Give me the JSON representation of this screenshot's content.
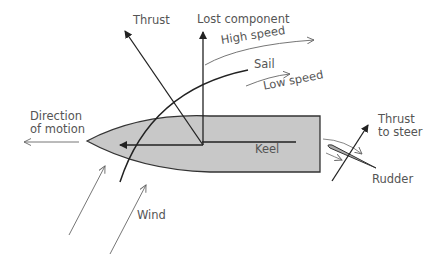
{
  "diagram": {
    "labels": {
      "thrust": "Thrust",
      "lost_component": "Lost component",
      "high_speed": "High speed",
      "sail": "Sail",
      "low_speed": "Low speed",
      "direction_line1": "Direction",
      "direction_line2": "of motion",
      "keel": "Keel",
      "thrust_to_steer_line1": "Thrust",
      "thrust_to_steer_line2": "to steer",
      "rudder": "Rudder",
      "wind": "Wind"
    },
    "colors": {
      "hull_fill": "#c8c8c8",
      "hull_stroke": "#333333",
      "force_arrow": "#222222",
      "flow_arrow": "#666666",
      "text": "#555555"
    }
  }
}
